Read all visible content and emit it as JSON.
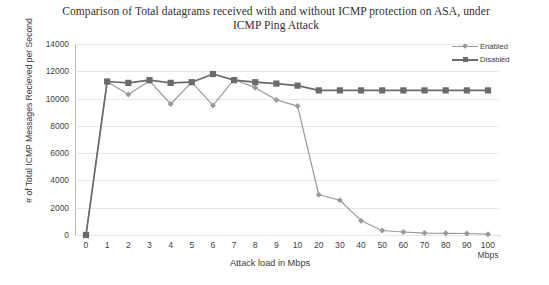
{
  "chart_data": {
    "type": "line",
    "title": "Comparison of Total datagrams received with and without ICMP protection on ASA, under ICMP Ping Attack",
    "title_line1": "Comparison of Total datagrams received with and without ICMP protection on",
    "title_line2": "ASA, under ICMP Ping Attack",
    "xlabel": "Attack load in Mbps",
    "ylabel": "# of Total ICMP Messages Recieved per Second",
    "x_unit_note": "Mbps",
    "categories": [
      "0",
      "1",
      "2",
      "3",
      "4",
      "5",
      "6",
      "7",
      "8",
      "9",
      "10",
      "20",
      "30",
      "40",
      "50",
      "60",
      "70",
      "80",
      "90",
      "100"
    ],
    "ylim": [
      0,
      14000
    ],
    "yticks": [
      0,
      2000,
      4000,
      6000,
      8000,
      10000,
      12000,
      14000
    ],
    "grid": true,
    "legend_position": "top-right",
    "series": [
      {
        "name": "Enabled",
        "color": "#9a9a9a",
        "marker": "diamond",
        "values": [
          0,
          11250,
          10300,
          11300,
          9600,
          11200,
          9500,
          11400,
          10800,
          9900,
          9450,
          2950,
          2550,
          1050,
          330,
          220,
          140,
          120,
          110,
          60
        ]
      },
      {
        "name": "Disabled",
        "color": "#6b6b6b",
        "marker": "square",
        "values": [
          0,
          11250,
          11150,
          11350,
          11150,
          11200,
          11800,
          11350,
          11200,
          11100,
          10950,
          10600,
          10600,
          10600,
          10600,
          10600,
          10600,
          10600,
          10600,
          10600
        ]
      }
    ]
  },
  "colors": {
    "enabled": "#9a9a9a",
    "disabled": "#6b6b6b",
    "grid": "#e6e6e6",
    "axis": "#b0b0b0",
    "text": "#3a3a3a"
  }
}
